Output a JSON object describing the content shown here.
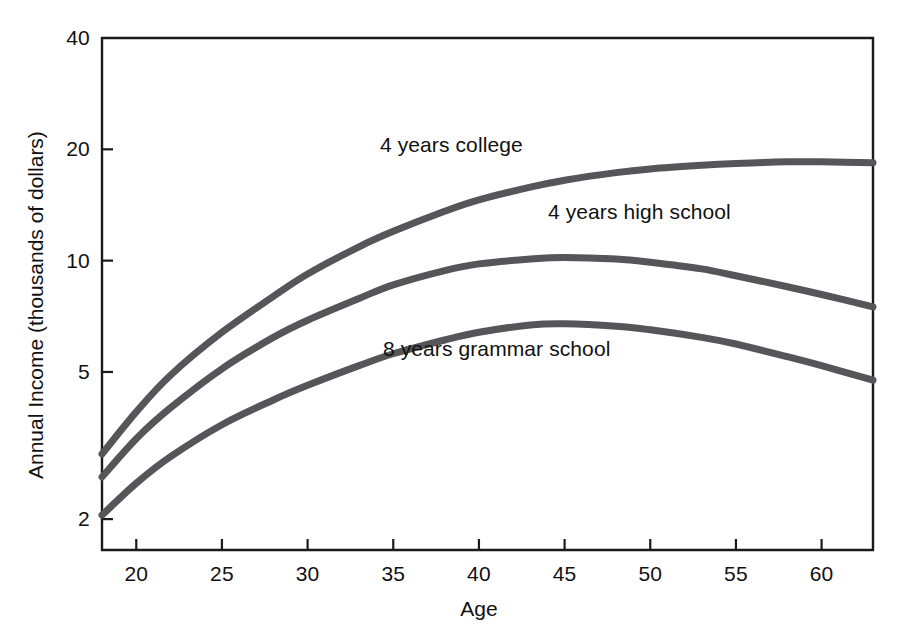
{
  "chart_data": {
    "type": "line",
    "title": "",
    "xlabel": "Age",
    "ylabel": "Annual Income (thousands of dollars)",
    "xlim": [
      18,
      63
    ],
    "ylim": [
      1.65,
      40
    ],
    "yscale": "log",
    "grid": false,
    "legend": "inline-annotations",
    "xticks": [
      20,
      25,
      30,
      35,
      40,
      45,
      50,
      55,
      60
    ],
    "xtick_labels": [
      "20",
      "25",
      "30",
      "35",
      "40",
      "45",
      "50",
      "55",
      "60"
    ],
    "yticks": [
      2,
      5,
      10,
      20,
      40
    ],
    "ytick_labels": [
      "2",
      "5",
      "10",
      "20",
      "40"
    ],
    "x": [
      18,
      20,
      22,
      25,
      28,
      30,
      33,
      35,
      38,
      40,
      43,
      45,
      48,
      50,
      53,
      55,
      58,
      60,
      63
    ],
    "series": [
      {
        "name": "4 years college",
        "label": "4 years college",
        "color": "#55555a",
        "values": [
          3.0,
          3.9,
          4.9,
          6.4,
          8.0,
          9.2,
          10.9,
          12.0,
          13.6,
          14.6,
          15.8,
          16.5,
          17.3,
          17.7,
          18.1,
          18.3,
          18.5,
          18.5,
          18.4
        ]
      },
      {
        "name": "4 years high school",
        "label": "4 years high school",
        "color": "#55555a",
        "values": [
          2.6,
          3.3,
          4.0,
          5.1,
          6.2,
          6.9,
          7.9,
          8.6,
          9.4,
          9.8,
          10.1,
          10.2,
          10.1,
          9.9,
          9.5,
          9.1,
          8.5,
          8.1,
          7.5
        ]
      },
      {
        "name": "8 years grammar school",
        "label": "8 years grammar school",
        "color": "#55555a",
        "values": [
          2.05,
          2.5,
          2.95,
          3.6,
          4.2,
          4.6,
          5.2,
          5.6,
          6.1,
          6.4,
          6.7,
          6.75,
          6.65,
          6.5,
          6.2,
          5.95,
          5.5,
          5.2,
          4.75
        ]
      }
    ],
    "annotations": [
      {
        "text": "4 years college",
        "x_px": 380,
        "y_px": 133
      },
      {
        "text": "4 years high school",
        "x_px": 548,
        "y_px": 200
      },
      {
        "text": "8 years grammar school",
        "x_px": 383,
        "y_px": 337
      }
    ]
  },
  "axes_geometry": {
    "left_px": 102,
    "right_px": 873,
    "top_px": 38,
    "bottom_px": 550
  }
}
